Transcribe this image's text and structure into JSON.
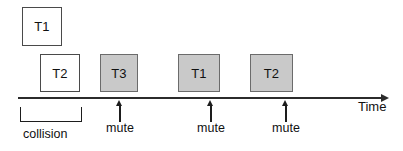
{
  "diagram": {
    "axis": {
      "label": "Time",
      "line_color": "#2b2b2b",
      "start_x": 18,
      "end_x": 388,
      "y": 98
    },
    "frames": [
      {
        "label": "T1",
        "fill": "white",
        "x": 22,
        "y": 7,
        "w": 40,
        "h": 39
      },
      {
        "label": "T2",
        "fill": "white",
        "x": 40,
        "y": 54,
        "w": 40,
        "h": 38
      },
      {
        "label": "T3",
        "fill": "gray",
        "x": 100,
        "y": 54,
        "w": 38,
        "h": 38
      },
      {
        "label": "T1",
        "fill": "gray",
        "x": 178,
        "y": 54,
        "w": 42,
        "h": 38
      },
      {
        "label": "T2",
        "fill": "gray",
        "x": 250,
        "y": 54,
        "w": 43,
        "h": 38
      }
    ],
    "mute_markers": [
      {
        "label": "mute",
        "x": 119
      },
      {
        "label": "mute",
        "x": 210
      },
      {
        "label": "mute",
        "x": 285
      }
    ],
    "collision": {
      "label": "collision",
      "bracket_x": 20,
      "bracket_width": 62,
      "bracket_y": 107,
      "bracket_height": 15,
      "label_x": 23,
      "label_y": 127
    },
    "colors": {
      "frame_white": "#ffffff",
      "frame_gray": "#c9c9c9",
      "stroke": "#4a4a4a",
      "text": "#111111",
      "background": "#ffffff"
    }
  }
}
